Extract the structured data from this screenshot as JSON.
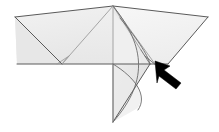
{
  "figure": {
    "title": "Origami folding step diagram",
    "background_color": "#ffffff",
    "stroke_color": "#555555",
    "fold_line_color": "#9a9a9a",
    "paper_fill_light": "#f2f2f2",
    "paper_fill_mid": "#e8e8e8",
    "paper_fill_dark": "#dedede",
    "paper_fill_lightest": "#f8f8f8",
    "arrow_color": "#000000",
    "arrow_label": "fold-here-arrow",
    "arrow_direction": "up-left",
    "labels": [],
    "annotations": []
  },
  "geometry": {
    "canvas": {
      "width": 219,
      "height": 132
    },
    "points": {
      "apex": [
        113,
        6
      ],
      "left_tip": [
        15,
        17
      ],
      "right_tip": [
        208,
        17
      ],
      "left_wing_bottom": [
        62,
        64
      ],
      "baseline_left": [
        17,
        64
      ],
      "baseline_right": [
        168,
        64
      ],
      "bottom_tip": [
        113,
        122
      ],
      "right_flap_hinge": [
        150,
        64
      ],
      "right_inner_vertex": [
        141,
        46
      ]
    },
    "shapes": [
      {
        "name": "left-wing-upper",
        "points": "15,17 113,6 113,64 17,64",
        "fill": "#eeeeee"
      },
      {
        "name": "left-wing-lower-triangle",
        "points": "15,17 62,64 17,64",
        "fill": "#e9e9e9"
      },
      {
        "name": "right-wing-upper",
        "points": "113,6 208,17 168,64 113,64",
        "fill": "#f4f4f4"
      },
      {
        "name": "center-bottom-flap",
        "points": "113,64 113,122 150,64",
        "fill": "#eaeaea"
      },
      {
        "name": "right-curved-flap",
        "points": "141,46 150,64 160,66",
        "fill": "#e4e4e4"
      }
    ],
    "fold_lines": [
      {
        "name": "center-vertical-fold",
        "from": [
          113,
          6
        ],
        "to": [
          113,
          122
        ]
      },
      {
        "name": "horizontal-baseline",
        "from": [
          17,
          64
        ],
        "to": [
          168,
          64
        ]
      },
      {
        "name": "left-diagonal-fold",
        "from": [
          113,
          6
        ],
        "to": [
          62,
          64
        ]
      },
      {
        "name": "right-diagonal-fold",
        "from": [
          113,
          6
        ],
        "to": [
          155,
          64
        ]
      },
      {
        "name": "left-notch-fold",
        "from": [
          62,
          64
        ],
        "to": [
          68,
          57
        ]
      },
      {
        "name": "right-inner-fold",
        "from": [
          113,
          6
        ],
        "to": [
          141,
          46
        ]
      }
    ],
    "curves": [
      {
        "name": "outer-curved-edge",
        "path": "M113,6 C140,40 150,80 113,122"
      },
      {
        "name": "inner-curved-edge",
        "path": "M128,30 C144,44 152,56 150,64"
      }
    ],
    "arrow": {
      "name": "fold-direction-arrow",
      "tip": [
        156,
        62
      ],
      "tail": [
        182,
        82
      ],
      "shaft_width": 7,
      "head_length": 13,
      "head_width": 15
    }
  }
}
